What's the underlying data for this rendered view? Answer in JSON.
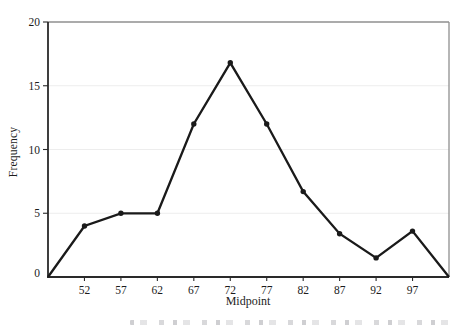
{
  "figure": {
    "background": "#ffffff"
  },
  "chart_data": {
    "type": "line",
    "title": "",
    "xlabel": "Midpoint",
    "ylabel": "Frequency",
    "legend": "none",
    "grid": "horizontal",
    "xlim": [
      47,
      102
    ],
    "ylim": [
      0,
      20
    ],
    "x_tick_labels": [
      "52",
      "57",
      "62",
      "67",
      "72",
      "77",
      "82",
      "87",
      "92",
      "97"
    ],
    "x_ticks": [
      52,
      57,
      62,
      67,
      72,
      77,
      82,
      87,
      92,
      97
    ],
    "y_tick_labels": [
      "0",
      "5",
      "10",
      "15",
      "20"
    ],
    "y_ticks": [
      0,
      5,
      10,
      15,
      20
    ],
    "y_gridlines": [
      5,
      10,
      15
    ],
    "series": [
      {
        "name": "frequency-polygon",
        "points": [
          {
            "x": 47,
            "y": 0,
            "marker": false
          },
          {
            "x": 52,
            "y": 4,
            "marker": true
          },
          {
            "x": 57,
            "y": 5,
            "marker": true
          },
          {
            "x": 62,
            "y": 5,
            "marker": true
          },
          {
            "x": 67,
            "y": 12,
            "marker": true
          },
          {
            "x": 72,
            "y": 16.8,
            "marker": true
          },
          {
            "x": 77,
            "y": 12,
            "marker": true
          },
          {
            "x": 82,
            "y": 6.7,
            "marker": true
          },
          {
            "x": 87,
            "y": 3.4,
            "marker": true
          },
          {
            "x": 92,
            "y": 1.5,
            "marker": true
          },
          {
            "x": 97,
            "y": 3.6,
            "marker": true
          },
          {
            "x": 102,
            "y": 0,
            "marker": false
          }
        ]
      }
    ],
    "colors": {
      "line": "#1a1a1a",
      "marker": "#1a1a1a",
      "gridline": "#ededed",
      "frame": "#8f8f8f",
      "axis": "#2a2a2a",
      "text": "#1c1c1c"
    }
  }
}
